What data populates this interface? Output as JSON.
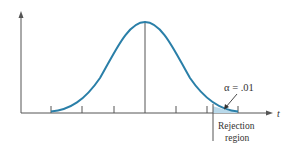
{
  "diagram": {
    "type": "t-distribution rejection region",
    "x_axis_label": "t",
    "alpha_label": "α = .01",
    "rejection_label_line1": "Rejection",
    "rejection_label_line2": "region",
    "curve_color": "#2a7fa8",
    "shade_color": "#b9d9ea",
    "axis_color": "#555555",
    "tick_count": 7
  }
}
